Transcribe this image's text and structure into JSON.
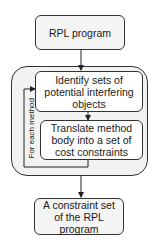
{
  "diagram": {
    "nodes": {
      "input": {
        "label": "RPL program"
      },
      "identify": {
        "label": "Identify sets of potential interfering objects"
      },
      "translate": {
        "label": "Translate method body into a set of cost constraints"
      },
      "output": {
        "label": "A constraint set of the RPL program"
      }
    },
    "loop_label": "For each method",
    "edges": [
      {
        "from": "input",
        "to": "identify"
      },
      {
        "from": "identify",
        "to": "translate"
      },
      {
        "from": "translate",
        "to": "identify",
        "label": "For each method"
      },
      {
        "from": "loop-group",
        "to": "output"
      }
    ]
  }
}
